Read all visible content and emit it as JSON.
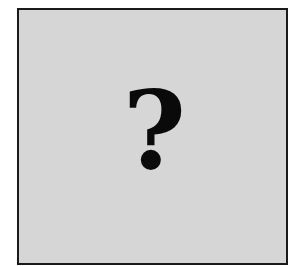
{
  "placeholder_image": {
    "symbol": "?",
    "symbol_name": "question-mark",
    "background_color": "#d6d6d6",
    "border_color": "#1a1a1a",
    "symbol_color": "#0a0a0a"
  }
}
